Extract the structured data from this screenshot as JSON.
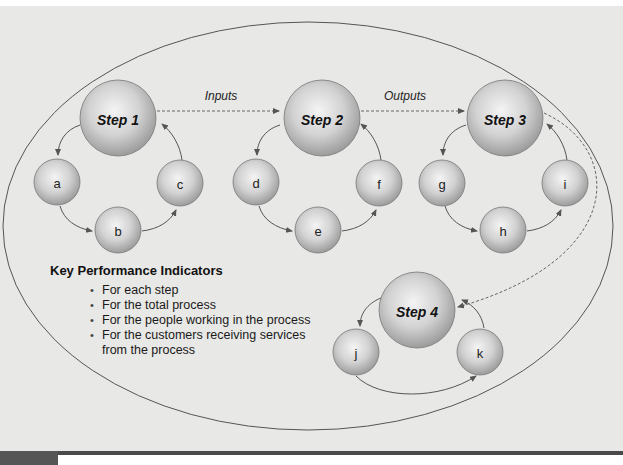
{
  "diagram": {
    "steps": [
      {
        "id": "step1",
        "label": "Step 1",
        "cx": 118,
        "cy": 118,
        "r": 38
      },
      {
        "id": "step2",
        "label": "Step 2",
        "cx": 322,
        "cy": 118,
        "r": 38
      },
      {
        "id": "step3",
        "label": "Step 3",
        "cx": 505,
        "cy": 118,
        "r": 38
      },
      {
        "id": "step4",
        "label": "Step 4",
        "cx": 417,
        "cy": 310,
        "r": 38
      }
    ],
    "substeps": [
      {
        "id": "a",
        "label": "a",
        "cx": 57,
        "cy": 182,
        "r": 23
      },
      {
        "id": "b",
        "label": "b",
        "cx": 118,
        "cy": 230,
        "r": 23
      },
      {
        "id": "c",
        "label": "c",
        "cx": 180,
        "cy": 183,
        "r": 23
      },
      {
        "id": "d",
        "label": "d",
        "cx": 256,
        "cy": 182,
        "r": 23
      },
      {
        "id": "e",
        "label": "e",
        "cx": 318,
        "cy": 230,
        "r": 23
      },
      {
        "id": "f",
        "label": "f",
        "cx": 379,
        "cy": 183,
        "r": 23
      },
      {
        "id": "g",
        "label": "g",
        "cx": 442,
        "cy": 183,
        "r": 23
      },
      {
        "id": "h",
        "label": "h",
        "cx": 503,
        "cy": 230,
        "r": 23
      },
      {
        "id": "i",
        "label": "i",
        "cx": 565,
        "cy": 183,
        "r": 23
      },
      {
        "id": "j",
        "label": "j",
        "cx": 356,
        "cy": 352,
        "r": 23
      },
      {
        "id": "k",
        "label": "k",
        "cx": 480,
        "cy": 352,
        "r": 23
      }
    ],
    "flows": [
      {
        "id": "inputs",
        "label": "Inputs",
        "from": "step1",
        "to": "step2",
        "x": 221,
        "y": 96
      },
      {
        "id": "outputs",
        "label": "Outputs",
        "from": "step2",
        "to": "step3",
        "x": 405,
        "y": 96
      },
      {
        "id": "step3-to-step4",
        "label": "",
        "from": "step3",
        "to": "step4"
      }
    ],
    "kpi": {
      "title": "Key Performance Indicators",
      "items": [
        "For each step",
        "For the total process",
        "For the people working in the process",
        "For the customers receiving services",
        "from the process"
      ]
    },
    "colors": {
      "background": "#e8e8e6",
      "outline": "#555555",
      "sphere_light": "#f2f2f2",
      "sphere_dark": "#9a9a9a"
    }
  }
}
